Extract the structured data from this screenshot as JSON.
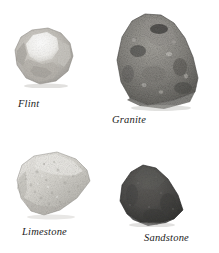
{
  "figure": {
    "background_color": "#ffffff",
    "width": 219,
    "height": 253,
    "layout": "2x2-grid-of-rock-specimens",
    "caption_color": "#1c1c1c"
  },
  "specimens": [
    {
      "id": "flint",
      "label": "Flint",
      "position": "top-left",
      "description": "angular pale rock with bright white conchoidal fracture face",
      "base_color": "#bdbab4",
      "highlight_color": "#f6f5f2",
      "shadow_color": "#8e8b86"
    },
    {
      "id": "granite",
      "label": "Granite",
      "position": "top-right",
      "description": "large speckled mid-gray block, rounded top, angular base",
      "base_color": "#8a8883",
      "highlight_color": "#b3b1ab",
      "shadow_color": "#4f4e4b"
    },
    {
      "id": "limestone",
      "label": "Limestone",
      "position": "bottom-left",
      "description": "pale porous wedge-shaped rock with pitted texture",
      "base_color": "#d2d0ca",
      "highlight_color": "#efeeea",
      "shadow_color": "#a5a39d"
    },
    {
      "id": "sandstone",
      "label": "Sandstone",
      "position": "bottom-right",
      "description": "dark gray rounded triangular shield-shaped rock, fine grain",
      "base_color": "#4a4a49",
      "highlight_color": "#6a6a68",
      "shadow_color": "#2c2c2b"
    }
  ]
}
